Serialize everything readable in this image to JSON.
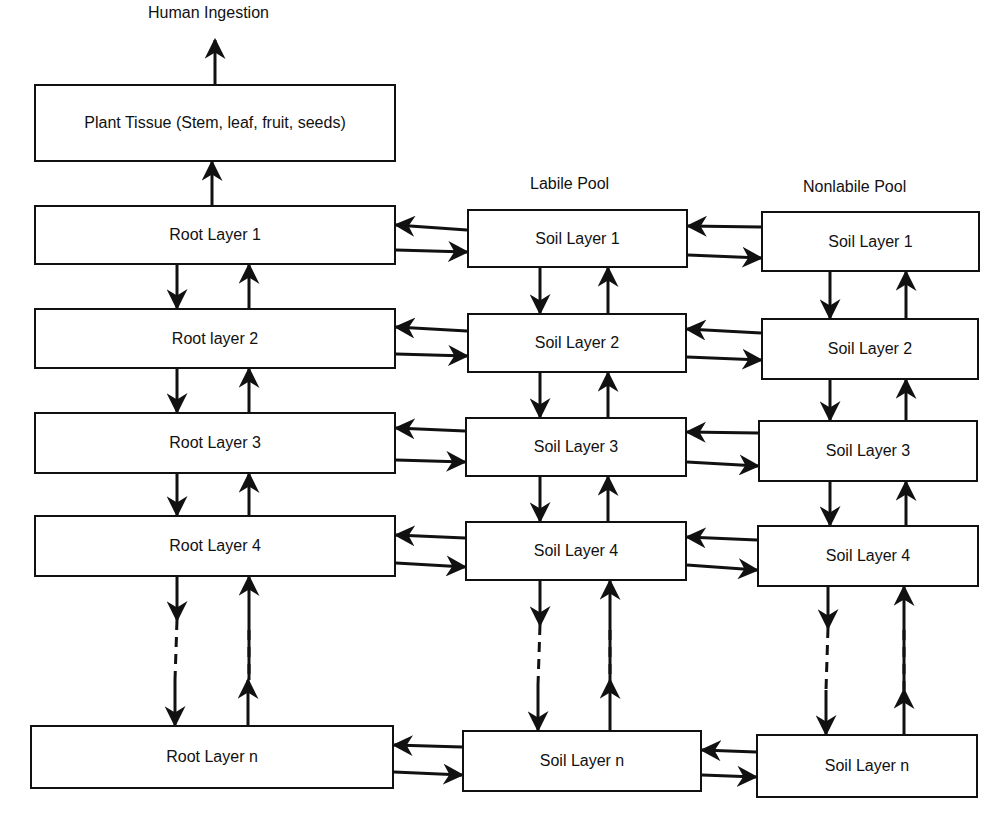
{
  "top_label": "Human Ingestion",
  "plant": {
    "label": "Plant Tissue (Stem, leaf, fruit, seeds)"
  },
  "columns": {
    "root": {
      "header": ""
    },
    "labile": {
      "header": "Labile Pool"
    },
    "nonlabile": {
      "header": "Nonlabile Pool"
    }
  },
  "rows": [
    {
      "root": "Root Layer 1",
      "labile": "Soil Layer 1",
      "nonlabile": "Soil Layer 1"
    },
    {
      "root": "Root layer 2",
      "labile": "Soil Layer 2",
      "nonlabile": "Soil Layer 2"
    },
    {
      "root": "Root Layer 3",
      "labile": "Soil Layer 3",
      "nonlabile": "Soil Layer 3"
    },
    {
      "root": "Root Layer 4",
      "labile": "Soil Layer 4",
      "nonlabile": "Soil Layer 4"
    },
    {
      "root": "Root Layer n",
      "labile": "Soil Layer n",
      "nonlabile": "Soil Layer n"
    }
  ],
  "colors": {
    "line": "#111111",
    "background": "#ffffff"
  }
}
